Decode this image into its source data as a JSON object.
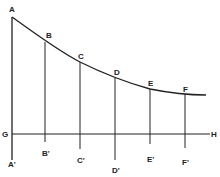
{
  "diagram": {
    "title": "",
    "curve_points": {
      "A": {
        "label": "A",
        "x": 12,
        "y": 17
      },
      "B": {
        "label": "B",
        "x": 45,
        "y": 42
      },
      "C": {
        "label": "C",
        "x": 80,
        "y": 62
      },
      "D": {
        "label": "D",
        "x": 115,
        "y": 78
      },
      "E": {
        "label": "E",
        "x": 150,
        "y": 89
      },
      "F": {
        "label": "F",
        "x": 185,
        "y": 94
      }
    },
    "base_points": {
      "A1": {
        "label": "A'",
        "x": 12,
        "y": 162
      },
      "B1": {
        "label": "B'",
        "x": 45,
        "y": 148
      },
      "C1": {
        "label": "C'",
        "x": 80,
        "y": 155
      },
      "D1": {
        "label": "D'",
        "x": 115,
        "y": 168
      },
      "E1": {
        "label": "E'",
        "x": 150,
        "y": 150
      },
      "F1": {
        "label": "F'",
        "x": 185,
        "y": 156
      }
    },
    "axis": {
      "start_label": "G",
      "end_label": "H",
      "y": 134
    },
    "line_color": "#222222"
  }
}
